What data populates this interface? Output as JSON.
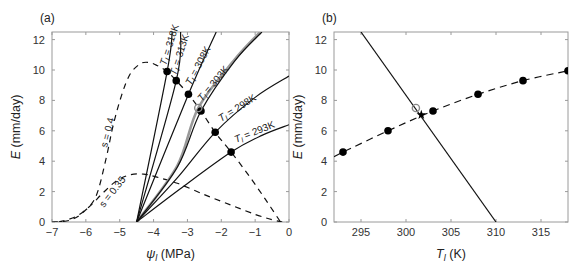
{
  "chart_data": [
    {
      "panel": "(a)",
      "type": "line",
      "xlabel": "ψl (MPa)",
      "xlabel_symbol": "ψ",
      "xlabel_sub": "l",
      "xlabel_unit": "(MPa)",
      "ylabel": "E (mm/day)",
      "ylabel_symbol": "E",
      "ylabel_unit": "(mm/day)",
      "xlim": [
        -7,
        0
      ],
      "ylim": [
        0,
        12.5
      ],
      "xticks": [
        -7,
        -6,
        -5,
        -4,
        -3,
        -2,
        -1,
        0
      ],
      "yticks": [
        0,
        2,
        4,
        6,
        8,
        10,
        12
      ],
      "grid": false,
      "solid_curves": [
        {
          "name": "Tl = 318K",
          "temp": "318K",
          "points": [
            [
              -4.5,
              0
            ],
            [
              -3.6,
              9.9
            ],
            [
              -3.45,
              12.5
            ]
          ]
        },
        {
          "name": "Tl = 313K",
          "temp": "313K",
          "points": [
            [
              -4.5,
              0
            ],
            [
              -3.33,
              9.3
            ],
            [
              -3.2,
              12.5
            ]
          ]
        },
        {
          "name": "Tl = 308K",
          "temp": "308K",
          "points": [
            [
              -4.5,
              0
            ],
            [
              -2.97,
              8.4
            ],
            [
              -2.15,
              12.5
            ]
          ]
        },
        {
          "name": "Tl = 303K",
          "temp": "303K",
          "points": [
            [
              -4.5,
              0
            ],
            [
              -3.3,
              3.6
            ],
            [
              -2.6,
              7.3
            ],
            [
              -1.6,
              10.6
            ],
            [
              -0.8,
              12.5
            ]
          ]
        },
        {
          "name": "Tl = 298K",
          "temp": "298K",
          "points": [
            [
              -4.5,
              0
            ],
            [
              -3.3,
              2.9
            ],
            [
              -2.18,
              5.9
            ],
            [
              -1.0,
              8.2
            ],
            [
              0,
              9.6
            ]
          ]
        },
        {
          "name": "Tl = 293K",
          "temp": "293K",
          "points": [
            [
              -4.5,
              0
            ],
            [
              -3.2,
              2.2
            ],
            [
              -1.71,
              4.6
            ],
            [
              -0.8,
              5.7
            ],
            [
              0,
              6.4
            ]
          ]
        }
      ],
      "grey_curve": {
        "name": "reference (grey)",
        "points": [
          [
            -4.5,
            0
          ],
          [
            -3.3,
            3.7
          ],
          [
            -2.68,
            7.5
          ],
          [
            -1.6,
            10.7
          ],
          [
            -0.85,
            12.5
          ]
        ]
      },
      "dashed_curves": [
        {
          "name": "s = 0.4",
          "label": "s = 0.4",
          "points": [
            [
              -7,
              0
            ],
            [
              -6.5,
              0.1
            ],
            [
              -6.1,
              0.6
            ],
            [
              -5.7,
              1.7
            ],
            [
              -5.4,
              4.2
            ],
            [
              -5.2,
              6.3
            ],
            [
              -4.95,
              8.3
            ],
            [
              -4.7,
              9.7
            ],
            [
              -4.4,
              10.4
            ],
            [
              -4.15,
              10.5
            ],
            [
              -3.9,
              10.3
            ],
            [
              -3.6,
              9.9
            ],
            [
              -3.33,
              9.3
            ],
            [
              -2.97,
              8.4
            ],
            [
              -2.6,
              7.3
            ],
            [
              -2.18,
              5.9
            ],
            [
              -1.71,
              4.6
            ],
            [
              -1.2,
              3.1
            ],
            [
              -0.7,
              1.5
            ],
            [
              -0.25,
              0
            ]
          ]
        },
        {
          "name": "s = 0.35",
          "label": "s = 0.35",
          "points": [
            [
              -6.8,
              0
            ],
            [
              -6.3,
              0.35
            ],
            [
              -5.9,
              1.0
            ],
            [
              -5.5,
              1.9
            ],
            [
              -5.1,
              2.7
            ],
            [
              -4.7,
              3.1
            ],
            [
              -4.3,
              3.15
            ],
            [
              -3.9,
              2.95
            ],
            [
              -3.3,
              2.55
            ],
            [
              -2.5,
              1.8
            ],
            [
              -1.7,
              1.1
            ],
            [
              -1.0,
              0.5
            ],
            [
              -0.5,
              0.15
            ],
            [
              -0.2,
              0
            ]
          ]
        }
      ],
      "filled_points": [
        [
          -3.6,
          9.9
        ],
        [
          -3.33,
          9.3
        ],
        [
          -2.97,
          8.4
        ],
        [
          -2.6,
          7.3
        ],
        [
          -2.18,
          5.9
        ],
        [
          -1.71,
          4.6
        ]
      ],
      "open_point": [
        -2.68,
        7.5
      ]
    },
    {
      "panel": "(b)",
      "type": "line",
      "xlabel": "Tl (K)",
      "xlabel_symbol": "T",
      "xlabel_sub": "l",
      "xlabel_unit": "(K)",
      "ylabel": "E (mm/day)",
      "ylabel_symbol": "E",
      "ylabel_unit": "(mm/day)",
      "xlim": [
        292,
        318
      ],
      "ylim": [
        0,
        12.5
      ],
      "xticks": [
        295,
        300,
        305,
        310,
        315
      ],
      "yticks": [
        0,
        2,
        4,
        6,
        8,
        10,
        12
      ],
      "grid": false,
      "dashed_curve": {
        "name": "E vs Tl at s = 0.4",
        "points": [
          [
            292,
            4.3
          ],
          [
            293,
            4.6
          ],
          [
            298,
            6.0
          ],
          [
            303,
            7.3
          ],
          [
            308,
            8.4
          ],
          [
            313,
            9.3
          ],
          [
            318,
            9.95
          ]
        ]
      },
      "solid_line": {
        "name": "energy balance",
        "points": [
          [
            295,
            12.5
          ],
          [
            310,
            0
          ]
        ]
      },
      "filled_points": [
        [
          293,
          4.6
        ],
        [
          298,
          6.0
        ],
        [
          303,
          7.3
        ],
        [
          308,
          8.4
        ],
        [
          313,
          9.3
        ],
        [
          318,
          9.95
        ]
      ],
      "open_point": [
        301.1,
        7.5
      ],
      "star_point": [
        301.7,
        7.05
      ]
    }
  ]
}
